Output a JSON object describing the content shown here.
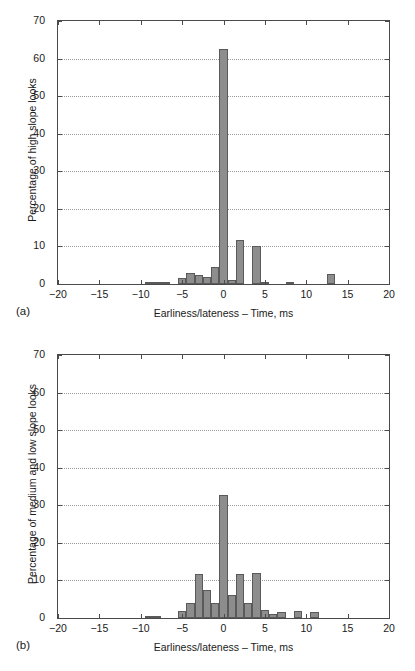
{
  "figure": {
    "panels": [
      {
        "caption": "(a)",
        "chart_data": {
          "type": "bar",
          "title": "",
          "subtitle": "",
          "xlabel": "Earliness/lateness – Time, ms",
          "ylabel": "Percentage of high slope looks",
          "xlim": [
            -20,
            20
          ],
          "ylim": [
            0,
            70
          ],
          "xticks": [
            -20,
            -15,
            -10,
            -5,
            0,
            5,
            10,
            15,
            20
          ],
          "xtick_labels": [
            "−20",
            "−15",
            "−10",
            "−5",
            "0",
            "5",
            "10",
            "15",
            "20"
          ],
          "yticks": [
            0,
            10,
            20,
            30,
            40,
            50,
            60,
            70
          ],
          "ytick_labels": [
            "0",
            "10",
            "20",
            "30",
            "40",
            "50",
            "60",
            "70"
          ],
          "grid": "horizontal-dotted",
          "legend": "none",
          "bar_width": 1,
          "x": [
            -9,
            -8,
            -7,
            -5,
            -4,
            -3,
            -2,
            -1,
            0,
            1,
            2,
            4,
            5,
            8,
            13
          ],
          "values": [
            0.2,
            0.3,
            0.3,
            1.5,
            3.0,
            2.5,
            1.8,
            4.5,
            62.5,
            1.0,
            11.8,
            10.0,
            0.3,
            0.5,
            2.7
          ]
        }
      },
      {
        "caption": "(b)",
        "chart_data": {
          "type": "bar",
          "title": "",
          "subtitle": "",
          "xlabel": "Earliness/lateness – Time, ms",
          "ylabel": "Percentage of medium and low slope looks",
          "xlim": [
            -20,
            20
          ],
          "ylim": [
            0,
            70
          ],
          "xticks": [
            -20,
            -15,
            -10,
            -5,
            0,
            5,
            10,
            15,
            20
          ],
          "xtick_labels": [
            "−20",
            "−15",
            "−10",
            "−5",
            "0",
            "5",
            "10",
            "15",
            "20"
          ],
          "yticks": [
            0,
            10,
            20,
            30,
            40,
            50,
            60,
            70
          ],
          "ytick_labels": [
            "0",
            "10",
            "20",
            "30",
            "40",
            "50",
            "60",
            "70"
          ],
          "grid": "horizontal-dotted",
          "legend": "none",
          "bar_width": 1,
          "x": [
            -9,
            -8,
            -5,
            -4,
            -3,
            -2,
            -1,
            0,
            1,
            2,
            3,
            4,
            5,
            6,
            7,
            9,
            11
          ],
          "values": [
            0.3,
            0.3,
            2.0,
            4.0,
            11.7,
            7.5,
            4.0,
            32.7,
            6.2,
            11.8,
            4.0,
            12.0,
            2.2,
            1.2,
            1.7,
            1.8,
            1.7
          ]
        }
      }
    ],
    "colors": {
      "bar_fill": "#8d8d8d",
      "bar_edge": "#5a5a5a",
      "axis": "#4a4a4a",
      "grid": "#9a9a9a",
      "text": "#1a1a1a",
      "background": "#ffffff"
    }
  }
}
